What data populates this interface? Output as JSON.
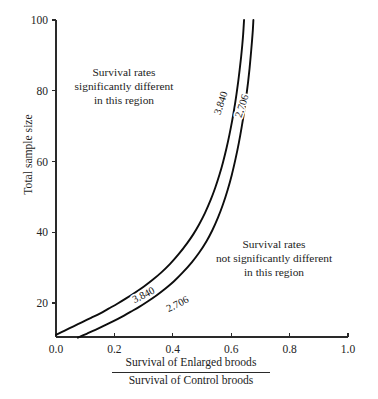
{
  "chart_data": {
    "type": "line",
    "title": "",
    "subtitle": "",
    "xlabel_numerator": "Survival of Enlarged broods",
    "xlabel_denominator": "Survival of Control broods",
    "ylabel": "Total sample size",
    "xlim": [
      0.0,
      1.0
    ],
    "ylim": [
      10,
      100
    ],
    "grid": false,
    "legend_position": "none",
    "xticks": [
      "0.0",
      "0.2",
      "0.4",
      "0.6",
      "0.8",
      "1.0"
    ],
    "xtick_values": [
      0.0,
      0.2,
      0.4,
      0.6,
      0.8,
      1.0
    ],
    "yticks": [
      "20",
      "40",
      "60",
      "80",
      "100"
    ],
    "ytick_values": [
      20,
      40,
      60,
      80,
      100
    ],
    "series": [
      {
        "name": "3.840",
        "label": "3.840",
        "comment": "chi-square critical value p=0.05",
        "points": [
          [
            0.0,
            11.0
          ],
          [
            0.03,
            12.2
          ],
          [
            0.06,
            13.4
          ],
          [
            0.09,
            14.6
          ],
          [
            0.12,
            15.8
          ],
          [
            0.15,
            17.0
          ],
          [
            0.18,
            18.4
          ],
          [
            0.21,
            19.8
          ],
          [
            0.24,
            21.3
          ],
          [
            0.27,
            22.9
          ],
          [
            0.3,
            24.6
          ],
          [
            0.33,
            26.5
          ],
          [
            0.36,
            28.6
          ],
          [
            0.39,
            31.0
          ],
          [
            0.42,
            33.8
          ],
          [
            0.45,
            37.0
          ],
          [
            0.47,
            39.4
          ],
          [
            0.49,
            42.2
          ],
          [
            0.51,
            45.4
          ],
          [
            0.53,
            49.2
          ],
          [
            0.545,
            52.5
          ],
          [
            0.56,
            56.3
          ],
          [
            0.572,
            59.8
          ],
          [
            0.584,
            63.8
          ],
          [
            0.594,
            67.6
          ],
          [
            0.603,
            71.4
          ],
          [
            0.611,
            75.2
          ],
          [
            0.618,
            79.0
          ],
          [
            0.624,
            82.6
          ],
          [
            0.629,
            86.0
          ],
          [
            0.634,
            89.6
          ],
          [
            0.638,
            93.0
          ],
          [
            0.641,
            96.0
          ],
          [
            0.644,
            100.0
          ]
        ]
      },
      {
        "name": "2.706",
        "label": "2.706",
        "comment": "chi-square critical value p=0.10",
        "points": [
          [
            0.075,
            10.2
          ],
          [
            0.105,
            11.3
          ],
          [
            0.135,
            12.4
          ],
          [
            0.165,
            13.6
          ],
          [
            0.195,
            14.8
          ],
          [
            0.225,
            16.1
          ],
          [
            0.255,
            17.5
          ],
          [
            0.285,
            18.9
          ],
          [
            0.315,
            20.5
          ],
          [
            0.345,
            22.2
          ],
          [
            0.375,
            24.1
          ],
          [
            0.405,
            26.2
          ],
          [
            0.435,
            28.7
          ],
          [
            0.465,
            31.5
          ],
          [
            0.49,
            34.2
          ],
          [
            0.515,
            37.4
          ],
          [
            0.535,
            40.5
          ],
          [
            0.555,
            44.2
          ],
          [
            0.572,
            47.9
          ],
          [
            0.588,
            52.0
          ],
          [
            0.602,
            56.2
          ],
          [
            0.615,
            60.8
          ],
          [
            0.626,
            65.2
          ],
          [
            0.636,
            69.8
          ],
          [
            0.645,
            74.4
          ],
          [
            0.652,
            78.6
          ],
          [
            0.658,
            82.6
          ],
          [
            0.663,
            86.4
          ],
          [
            0.667,
            90.0
          ],
          [
            0.671,
            93.8
          ],
          [
            0.674,
            97.0
          ],
          [
            0.676,
            100.0
          ]
        ]
      }
    ],
    "curve_labels": [
      {
        "text": "3.840",
        "x": 145,
        "y": 298,
        "rotation": -27
      },
      {
        "text": "2.706",
        "x": 179,
        "y": 307,
        "rotation": -27
      },
      {
        "text": "3.840",
        "x": 224,
        "y": 104,
        "rotation": -72
      },
      {
        "text": "2.706",
        "x": 245,
        "y": 107,
        "rotation": -72
      }
    ],
    "annotations": [
      {
        "id": "significant",
        "lines": [
          "Survival rates",
          "significantly different",
          "in this region"
        ]
      },
      {
        "id": "not-significant",
        "lines": [
          "Survival rates",
          "not significantly different",
          "in this region"
        ]
      }
    ],
    "colors": {
      "background": "#ffffff",
      "curve": "#0d0d0d",
      "axis": "#2a2a2a",
      "text": "#1c1c1c"
    }
  }
}
